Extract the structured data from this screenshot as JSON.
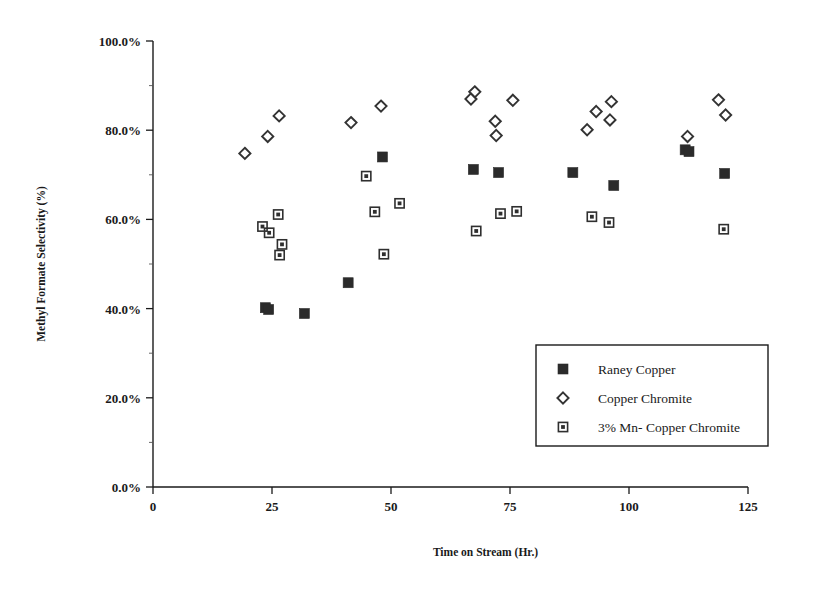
{
  "chart_data": {
    "type": "scatter",
    "title": "",
    "xlabel": "Time on Stream (Hr.)",
    "ylabel": "Methyl Formate Selectivity (%)",
    "xlim": [
      0,
      125
    ],
    "ylim": [
      0,
      100
    ],
    "xticks": [
      0,
      25,
      50,
      75,
      100,
      125
    ],
    "xtick_labels": [
      "0",
      "25",
      "50",
      "75",
      "100",
      "125"
    ],
    "yticks": [
      0,
      20,
      40,
      60,
      80,
      100
    ],
    "ytick_labels": [
      "0.0%",
      "20.0%",
      "40.0%",
      "60.0%",
      "80.0%",
      "100.0%"
    ],
    "grid": false,
    "legend_position": "center-right-lower",
    "series": [
      {
        "name": "Raney Copper",
        "marker": "filled-square",
        "color": "#2b2b2b",
        "points": [
          {
            "x": 23.6,
            "y": 40.2
          },
          {
            "x": 24.3,
            "y": 39.8
          },
          {
            "x": 31.8,
            "y": 38.9
          },
          {
            "x": 41.0,
            "y": 45.8
          },
          {
            "x": 48.2,
            "y": 74.0
          },
          {
            "x": 67.3,
            "y": 71.2
          },
          {
            "x": 72.6,
            "y": 70.5
          },
          {
            "x": 88.2,
            "y": 70.5
          },
          {
            "x": 96.8,
            "y": 67.6
          },
          {
            "x": 111.8,
            "y": 75.6
          },
          {
            "x": 112.6,
            "y": 75.2
          },
          {
            "x": 120.1,
            "y": 70.3
          }
        ]
      },
      {
        "name": "Copper Chromite",
        "marker": "open-diamond",
        "color": "#333333",
        "points": [
          {
            "x": 19.3,
            "y": 74.8
          },
          {
            "x": 24.1,
            "y": 78.6
          },
          {
            "x": 26.5,
            "y": 83.2
          },
          {
            "x": 41.6,
            "y": 81.7
          },
          {
            "x": 47.9,
            "y": 85.4
          },
          {
            "x": 66.8,
            "y": 87.0
          },
          {
            "x": 67.6,
            "y": 88.6
          },
          {
            "x": 71.9,
            "y": 82.0
          },
          {
            "x": 72.1,
            "y": 78.8
          },
          {
            "x": 75.6,
            "y": 86.7
          },
          {
            "x": 91.2,
            "y": 80.1
          },
          {
            "x": 93.1,
            "y": 84.2
          },
          {
            "x": 96.3,
            "y": 86.4
          },
          {
            "x": 96.0,
            "y": 82.3
          },
          {
            "x": 112.3,
            "y": 78.6
          },
          {
            "x": 118.8,
            "y": 86.8
          },
          {
            "x": 120.3,
            "y": 83.4
          }
        ]
      },
      {
        "name": "3% Mn- Copper Chromite",
        "marker": "star-square",
        "color": "#2f2f2f",
        "points": [
          {
            "x": 23.0,
            "y": 58.4
          },
          {
            "x": 24.4,
            "y": 57.0
          },
          {
            "x": 26.3,
            "y": 61.1
          },
          {
            "x": 27.1,
            "y": 54.4
          },
          {
            "x": 26.6,
            "y": 52.0
          },
          {
            "x": 44.8,
            "y": 69.7
          },
          {
            "x": 46.6,
            "y": 61.7
          },
          {
            "x": 48.5,
            "y": 52.2
          },
          {
            "x": 51.8,
            "y": 63.6
          },
          {
            "x": 67.9,
            "y": 57.4
          },
          {
            "x": 73.0,
            "y": 61.3
          },
          {
            "x": 76.4,
            "y": 61.8
          },
          {
            "x": 92.2,
            "y": 60.6
          },
          {
            "x": 95.8,
            "y": 59.3
          },
          {
            "x": 119.9,
            "y": 57.8
          }
        ]
      }
    ]
  },
  "legend": {
    "items": [
      {
        "label": "Raney Copper",
        "marker": "filled-square"
      },
      {
        "label": "Copper Chromite",
        "marker": "open-diamond"
      },
      {
        "label": "3% Mn- Copper Chromite",
        "marker": "star-square"
      }
    ]
  },
  "axes": {
    "x_title": "Time on Stream (Hr.)",
    "y_title": "Methyl Formate Selectivity (%)"
  }
}
